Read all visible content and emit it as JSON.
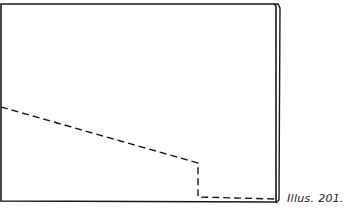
{
  "figure": {
    "caption": "Illus. 201.",
    "line_color": "#1a1a1a",
    "background": "#ffffff"
  }
}
